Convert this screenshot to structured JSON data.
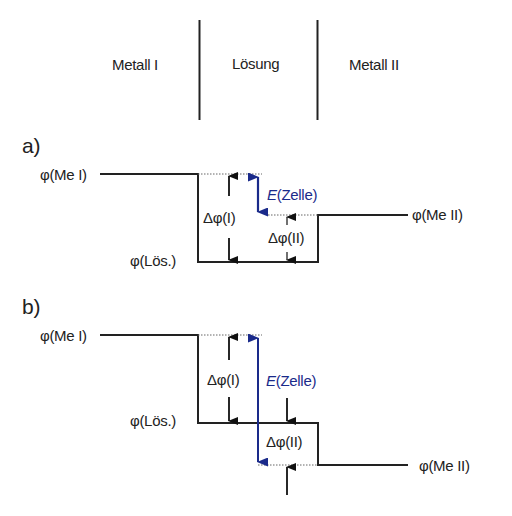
{
  "header": {
    "regions": [
      "Metall I",
      "Lösung",
      "Metall II"
    ]
  },
  "panels": [
    {
      "label": "a)",
      "phi_me1": "φ(Me I)",
      "phi_loes": "φ(Lös.)",
      "phi_me2": "φ(Me II)",
      "delta_phi_1": "Δφ(I)",
      "delta_phi_2": "Δφ(II)",
      "e_cell_prefix": "E",
      "e_cell_suffix": "(Zelle)"
    },
    {
      "label": "b)",
      "phi_me1": "φ(Me I)",
      "phi_loes": "φ(Lös.)",
      "phi_me2": "φ(Me II)",
      "delta_phi_1": "Δφ(I)",
      "delta_phi_2": "Δφ(II)",
      "e_cell_prefix": "E",
      "e_cell_suffix": "(Zelle)"
    }
  ],
  "colors": {
    "line": "#222222",
    "accent_blue": "#1a2a8a"
  }
}
